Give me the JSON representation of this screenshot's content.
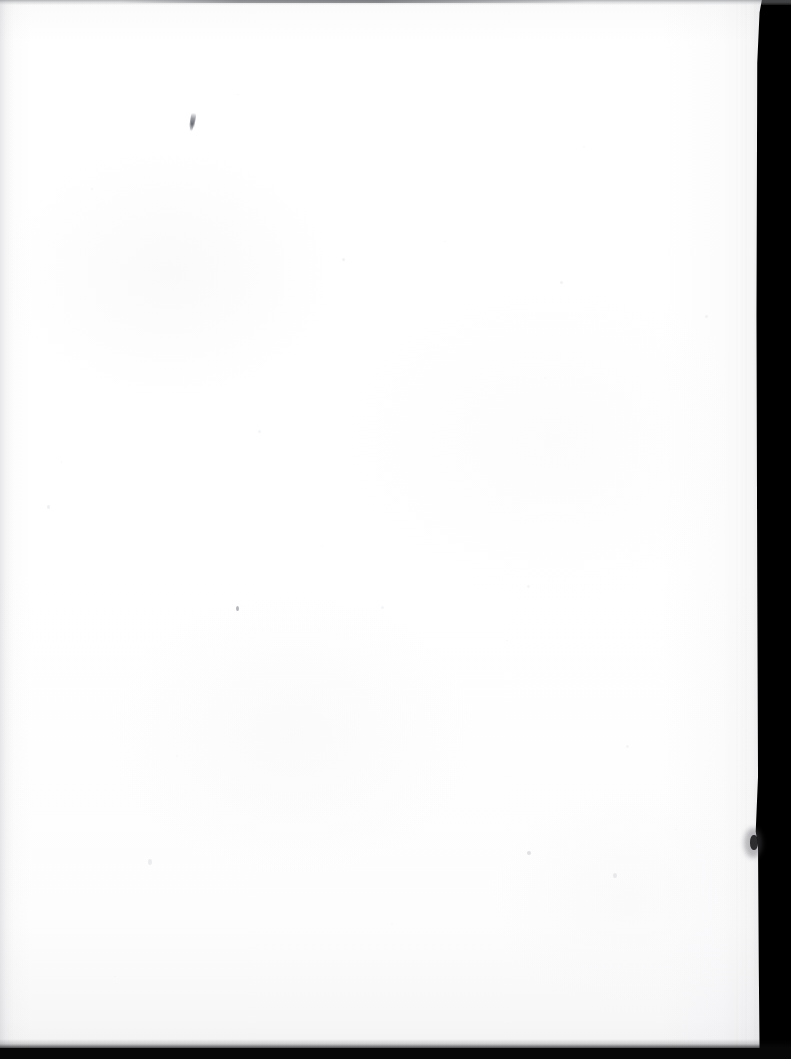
{
  "document": {
    "kind": "scanned-page",
    "description": "Scanned blank page (book endpaper / flyleaf)",
    "caption": "",
    "page_text": "",
    "body_text": "",
    "header_text": "",
    "footer_text": "",
    "page_number": "",
    "visible_text": []
  },
  "scan": {
    "width_px": 791,
    "height_px": 1059,
    "background_label": "scanner-bed",
    "orientation": "portrait"
  },
  "paper": {
    "label": "paper-sheet",
    "color": "#fdfdfd",
    "tone_top": "#fafafa",
    "tone_bottom": "#f2f2f3",
    "gutter_shadow_color": "#afafb6",
    "fore_edge_shadow_color": "#787884",
    "sheet_width_px": 768,
    "sheet_height_px": 1050
  },
  "colors": {
    "scanner_background": "#000000",
    "paper_white": "#fdfdfd",
    "paper_warm_white": "#ffffff",
    "edge_dark": "#080808",
    "top_strip_gray": "#70727a",
    "ink_mark": "#4a4c56",
    "speck_gray": "#8c8e98"
  },
  "artifacts": {
    "top_edge_strip": {
      "label": "top-scan-edge",
      "y": 0,
      "height": 5
    },
    "bottom_edge_strip": {
      "label": "bottom-scan-edge",
      "y": 1048,
      "height": 11
    },
    "edge_nick": {
      "label": "fore-edge-nick",
      "x": 751,
      "y": 835,
      "width": 7,
      "height": 16
    },
    "ink_tick": {
      "label": "ink-tick-mark",
      "x": 190,
      "y": 113,
      "width": 5,
      "height": 18
    },
    "specks": [
      {
        "label": "paper-speck",
        "x": 236,
        "y": 607,
        "size": 3,
        "opacity": 0.55
      },
      {
        "label": "paper-speck",
        "x": 527,
        "y": 851,
        "size": 2,
        "opacity": 0.3
      },
      {
        "label": "paper-speck",
        "x": 613,
        "y": 873,
        "size": 2,
        "opacity": 0.22
      },
      {
        "label": "paper-speck",
        "x": 148,
        "y": 860,
        "size": 2,
        "opacity": 0.22
      },
      {
        "label": "paper-speck",
        "x": 47,
        "y": 505,
        "size": 2,
        "opacity": 0.2
      },
      {
        "label": "paper-speck",
        "x": 342,
        "y": 258,
        "size": 2,
        "opacity": 0.18
      },
      {
        "label": "paper-speck",
        "x": 560,
        "y": 281,
        "size": 2,
        "opacity": 0.18
      },
      {
        "label": "paper-speck",
        "x": 705,
        "y": 315,
        "size": 2,
        "opacity": 0.18
      },
      {
        "label": "paper-speck",
        "x": 258,
        "y": 430,
        "size": 2,
        "opacity": 0.16
      },
      {
        "label": "paper-speck",
        "x": 381,
        "y": 606,
        "size": 2,
        "opacity": 0.16
      },
      {
        "label": "paper-speck",
        "x": 527,
        "y": 585,
        "size": 2,
        "opacity": 0.15
      },
      {
        "label": "paper-speck",
        "x": 626,
        "y": 745,
        "size": 2,
        "opacity": 0.15
      }
    ]
  }
}
